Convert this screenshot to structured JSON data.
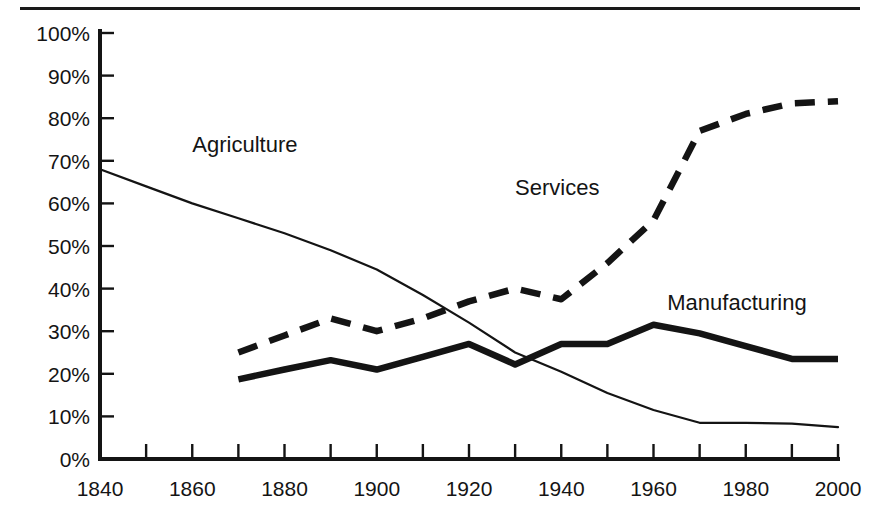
{
  "figure": {
    "background_color": "#ffffff",
    "ink_color": "#141414",
    "top_rule": true
  },
  "chart_data": {
    "type": "line",
    "title": "",
    "subtitle": "",
    "xlabel": "",
    "ylabel": "",
    "xlim": [
      1840,
      2000
    ],
    "ylim": [
      0,
      100
    ],
    "grid": false,
    "legend_position": "inline-annotations",
    "x_tick_interval": 10,
    "x_label_interval": 20,
    "x_tick_labels": [
      "1840",
      "1860",
      "1880",
      "1900",
      "1920",
      "1940",
      "1960",
      "1980",
      "2000"
    ],
    "x_tick_values": [
      1840,
      1860,
      1880,
      1900,
      1920,
      1940,
      1960,
      1980,
      2000
    ],
    "y_tick_labels": [
      "0%",
      "10%",
      "20%",
      "30%",
      "40%",
      "50%",
      "60%",
      "70%",
      "80%",
      "90%",
      "100%"
    ],
    "y_tick_values": [
      0,
      10,
      20,
      30,
      40,
      50,
      60,
      70,
      80,
      90,
      100
    ],
    "series": [
      {
        "name": "Agriculture",
        "style": "thin-solid",
        "label_x": 1860,
        "label_y": 72,
        "x": [
          1840,
          1850,
          1860,
          1870,
          1880,
          1890,
          1900,
          1910,
          1920,
          1930,
          1940,
          1950,
          1960,
          1970,
          1980,
          1990,
          2000
        ],
        "values": [
          68,
          64,
          60,
          56.5,
          53,
          49,
          44.5,
          38.5,
          32,
          25,
          20.5,
          15.5,
          11.5,
          8.5,
          8.5,
          8.3,
          7.5
        ]
      },
      {
        "name": "Manufacturing",
        "style": "thick-solid",
        "label_x": 1963,
        "label_y": 35,
        "x": [
          1870,
          1880,
          1890,
          1900,
          1910,
          1920,
          1930,
          1940,
          1950,
          1960,
          1970,
          1980,
          1990,
          2000
        ],
        "values": [
          18.7,
          21,
          23.2,
          21,
          24,
          27,
          22.2,
          27,
          27,
          31.5,
          29.5,
          26.5,
          23.5,
          23.5
        ]
      },
      {
        "name": "Services",
        "style": "thick-dashed",
        "label_x": 1930,
        "label_y": 62,
        "x": [
          1870,
          1880,
          1890,
          1900,
          1910,
          1920,
          1930,
          1940,
          1950,
          1960,
          1970,
          1980,
          1990,
          2000
        ],
        "values": [
          25,
          29,
          33,
          30,
          33,
          37,
          40,
          37.5,
          46,
          56,
          77,
          81,
          83.5,
          84
        ]
      }
    ]
  },
  "annotations": {
    "agriculture_label": "Agriculture",
    "services_label": "Services",
    "manufacturing_label": "Manufacturing"
  }
}
